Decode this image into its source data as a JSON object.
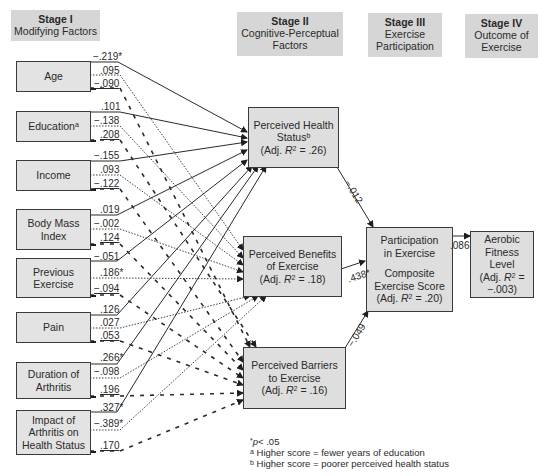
{
  "headers": {
    "stage1": {
      "title": "Stage I",
      "subtitle": "Modifying Factors"
    },
    "stage2": {
      "title": "Stage II",
      "subtitle1": "Cognitive-Perceptual",
      "subtitle2": "Factors"
    },
    "stage3": {
      "title": "Stage III",
      "subtitle1": "Exercise",
      "subtitle2": "Participation"
    },
    "stage4": {
      "title": "Stage IV",
      "subtitle1": "Outcome of",
      "subtitle2": "Exercise"
    }
  },
  "modifying_factors": [
    {
      "line1": "Age",
      "line2": "",
      "sup": "",
      "coef_health": "−.219*",
      "coef_benefits": ".095",
      "coef_barriers": "−.090"
    },
    {
      "line1": "Education",
      "line2": "",
      "sup": "a",
      "coef_health": ".101",
      "coef_benefits": "−.138",
      "coef_barriers": ".208"
    },
    {
      "line1": "Income",
      "line2": "",
      "sup": "",
      "coef_health": "−.155",
      "coef_benefits": ".093",
      "coef_barriers": "−.122"
    },
    {
      "line1": "Body Mass",
      "line2": "Index",
      "sup": "",
      "coef_health": ".019",
      "coef_benefits": "−.002",
      "coef_barriers": ".124"
    },
    {
      "line1": "Previous",
      "line2": "Exercise",
      "sup": "",
      "coef_health": "−.051",
      "coef_benefits": ".186*",
      "coef_barriers": "−.094"
    },
    {
      "line1": "Pain",
      "line2": "",
      "sup": "",
      "coef_health": ".126",
      "coef_benefits": ".027",
      "coef_barriers": ".053"
    },
    {
      "line1": "Duration of",
      "line2": "Arthritis",
      "sup": "",
      "coef_health": ".266*",
      "coef_benefits": "−.098",
      "coef_barriers": ".196"
    },
    {
      "line1": "Impact of",
      "line2": "Arthritis on",
      "line3": "Health Status",
      "sup": "",
      "coef_health": ".327*",
      "coef_benefits": "−.389*",
      "coef_barriers": ".170"
    }
  ],
  "stage2_boxes": {
    "health": {
      "line1": "Perceived Health",
      "line2": "Status",
      "sup": "b",
      "r2_prefix": "(Adj. ",
      "r2_var": "R",
      "r2_value": " = .26)"
    },
    "benefits": {
      "line1": "Perceived Benefits",
      "line2": "of Exercise",
      "r2_prefix": "(Adj. ",
      "r2_var": "R",
      "r2_value": " = .18)"
    },
    "barriers": {
      "line1": "Perceived Barriers",
      "line2": "to Exercise",
      "r2_prefix": "(Adj. ",
      "r2_var": "R",
      "r2_value": " = .16)"
    }
  },
  "stage3_box": {
    "line1": "Participation",
    "line2": "in Exercise",
    "line3": "Composite",
    "line4": "Exercise Score",
    "r2_prefix": "(Adj. ",
    "r2_var": "R",
    "r2_value": " = .20)"
  },
  "stage4_box": {
    "line1": "Aerobic",
    "line2": "Fitness",
    "line3": "Level",
    "r2_prefix": "(Adj. ",
    "r2_var": "R",
    "r2_value": " =",
    "r2_line2": "−.003)"
  },
  "paths": {
    "health_to_participation": "−.012",
    "benefits_to_participation": ".438*",
    "barriers_to_participation": "−.049",
    "participation_to_fitness": ".086"
  },
  "notes": {
    "sig": "p",
    "sig_rest": "< .05",
    "note_a_mark": "a",
    "note_a": " Higher score = fewer years of education",
    "note_b_mark": "b",
    "note_b": " Higher score = poorer perceived health status"
  },
  "colors": {
    "header_bg": "#d6d6d6",
    "box_bg": "#e3e3e3",
    "line": "#2a2a2a"
  }
}
